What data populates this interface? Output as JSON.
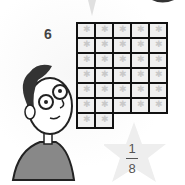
{
  "problem": {
    "number": "6"
  },
  "grid": {
    "columns": 5,
    "full_rows": 6,
    "partial_row_cells": 2,
    "total_cells": 32,
    "cell_icon": "star-icon"
  },
  "fraction": {
    "numerator": "1",
    "denominator": "8"
  },
  "colors": {
    "grid_line": "#111111",
    "cell_fill": "#f0f0f0",
    "star_fill": "#e6e6e6",
    "text": "#444444"
  }
}
